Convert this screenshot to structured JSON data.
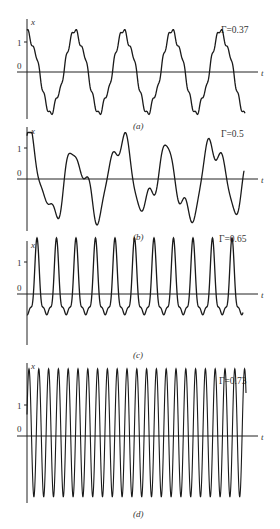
{
  "chart_data": [
    {
      "type": "line",
      "panel_label": "(a)",
      "parameter_label": "Γ=0.37",
      "parameter": 0.37,
      "xlabel": "t",
      "ylabel": "x",
      "yticks": [
        0,
        1
      ],
      "ytick_labels": [
        "0",
        "1"
      ],
      "ylim": [
        -1.6,
        1.6
      ],
      "description": "Period-2-like subharmonic oscillation with wiggles on plateaus; ~4.5 cycles shown",
      "cycles_shown": 4.6,
      "x_positions_of_maxima_px": [
        27,
        82,
        131,
        179,
        227
      ],
      "peak_value": 1.4,
      "plateau_high": 1.05,
      "plateau_low": -1.05,
      "trough_value": -1.4
    },
    {
      "type": "line",
      "panel_label": "(b)",
      "parameter_label": "Γ=0.5",
      "parameter": 0.5,
      "xlabel": "t",
      "ylabel": "x",
      "yticks": [
        0,
        1
      ],
      "ytick_labels": [
        "0",
        "1"
      ],
      "ylim": [
        -1.6,
        1.6
      ],
      "description": "Irregular (chaotic) oscillation with varying peaks between about -1.5 and 1.5"
    },
    {
      "type": "line",
      "panel_label": "(c)",
      "parameter_label": "Γ=0.65",
      "parameter": 0.65,
      "xlabel": "t",
      "ylabel": "x",
      "yticks": [
        0,
        1
      ],
      "ytick_labels": [
        "0",
        "1"
      ],
      "ylim": [
        -1.6,
        1.6
      ],
      "description": "Periodic oscillation, sharp peaks near 1.5 with double-dip troughs near -1.3",
      "cycles_shown": 12,
      "peak_value": 1.55,
      "trough_value": -1.35
    },
    {
      "type": "line",
      "panel_label": "(d)",
      "parameter_label": "Γ=0.73",
      "parameter": 0.73,
      "xlabel": "t",
      "ylabel": "x",
      "yticks": [
        0,
        1
      ],
      "ytick_labels": [
        "0",
        "1"
      ],
      "ylim": [
        -2.0,
        2.0
      ],
      "description": "High-amplitude simple periodic oscillation, ~22 cycles",
      "cycles_shown": 22.5,
      "peak_value": 1.95,
      "trough_value": -1.95
    }
  ],
  "panels": [
    {
      "label": "(a)",
      "gamma": "Γ=0.37",
      "x_axis": "x",
      "t_axis": "t",
      "tick_one": "1",
      "tick_zero": "0"
    },
    {
      "label": "(b)",
      "gamma": "Γ=0.5",
      "x_axis": "x",
      "t_axis": "t",
      "tick_one": "1",
      "tick_zero": "0"
    },
    {
      "label": "(c)",
      "gamma": "Γ=0.65",
      "x_axis": "x",
      "t_axis": "t",
      "tick_one": "1",
      "tick_zero": "0"
    },
    {
      "label": "(d)",
      "gamma": "Γ=0.73",
      "x_axis": "x",
      "t_axis": "t",
      "tick_one": "1",
      "tick_zero": "0"
    }
  ]
}
